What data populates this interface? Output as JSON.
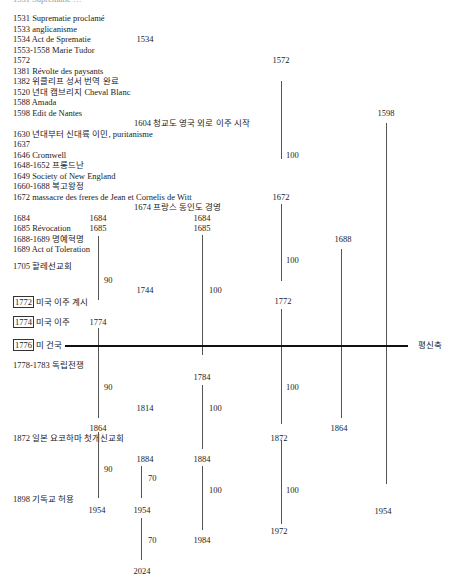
{
  "header_cut_text": "1531 Suprematie …",
  "events": [
    {
      "label": "1531 Suprematie proclamé",
      "x": 13,
      "y": 13
    },
    {
      "label": "1533 anglicanisme",
      "x": 13,
      "y": 24
    },
    {
      "label": "1534 Act de Sprematie",
      "x": 13,
      "y": 34
    },
    {
      "label": "1553-1558 Marie Tudor",
      "x": 13,
      "y": 45
    },
    {
      "label": "1572",
      "x": 13,
      "y": 55
    },
    {
      "label": "1381 Révolte des paysants",
      "x": 13,
      "y": 66
    },
    {
      "label": "1382 위클리프 성서 번역 완료",
      "x": 13,
      "y": 76
    },
    {
      "label": "1520 년대 캠브리지 Cheval Blanc",
      "x": 13,
      "y": 87
    },
    {
      "label": "1588 Amada",
      "x": 13,
      "y": 97
    },
    {
      "label": "1598 Edit de Nantes",
      "x": 13,
      "y": 108
    },
    {
      "label": "1604 청교도 영국 외로 이주 시작",
      "x": 134,
      "y": 118
    },
    {
      "label": "1630 년대부터 신대륙 이민, puritanisme",
      "x": 13,
      "y": 129
    },
    {
      "label": "1637",
      "x": 13,
      "y": 139
    },
    {
      "label": "1646 Cromwell",
      "x": 13,
      "y": 150
    },
    {
      "label": "1648-1652 프롱드난",
      "x": 13,
      "y": 160
    },
    {
      "label": "1649 Society of New England",
      "x": 13,
      "y": 171
    },
    {
      "label": "1660-1688 복고왕정",
      "x": 13,
      "y": 181
    },
    {
      "label": "1672 massacre des freres de Jean et Cornelis de Witt",
      "x": 13,
      "y": 192
    },
    {
      "label": "1674 프랑스 동인도 경영",
      "x": 134,
      "y": 202
    },
    {
      "label": "1684",
      "x": 13,
      "y": 213
    },
    {
      "label": "1685 Révocation",
      "x": 13,
      "y": 223
    },
    {
      "label": "1688-1689 명예혁명",
      "x": 13,
      "y": 234
    },
    {
      "label": "1689 Act of Toleration",
      "x": 13,
      "y": 244
    },
    {
      "label": "1705 할레선교회",
      "x": 13,
      "y": 261
    },
    {
      "label": "미국 이주 계시",
      "x": 13,
      "y": 297,
      "boxed_year": "1772"
    },
    {
      "label": "미국 이주",
      "x": 13,
      "y": 317,
      "boxed_year": "1774"
    },
    {
      "label": "미 건국",
      "x": 13,
      "y": 340,
      "boxed_year": "1776"
    },
    {
      "label": "1778-1783 독립전쟁",
      "x": 13,
      "y": 360
    },
    {
      "label": "1872 일본 요코하마 첫개신교회",
      "x": 13,
      "y": 433
    },
    {
      "label": "1898 기독교 허용",
      "x": 13,
      "y": 494
    }
  ],
  "axis": {
    "label": "평신축",
    "label_x": 418,
    "label_y": 340,
    "x1": 65,
    "x2": 408,
    "y": 345
  },
  "year_labels": [
    {
      "text": "1534",
      "x": 145,
      "y": 34
    },
    {
      "text": "1572",
      "x": 281,
      "y": 55
    },
    {
      "text": "1598",
      "x": 386,
      "y": 108
    },
    {
      "text": "1672",
      "x": 281,
      "y": 192
    },
    {
      "text": "1684",
      "x": 98,
      "y": 213
    },
    {
      "text": "1684",
      "x": 202,
      "y": 213
    },
    {
      "text": "1685",
      "x": 98,
      "y": 223
    },
    {
      "text": "1685",
      "x": 202,
      "y": 223
    },
    {
      "text": "1688",
      "x": 343,
      "y": 234
    },
    {
      "text": "1744",
      "x": 145,
      "y": 285
    },
    {
      "text": "1772",
      "x": 283,
      "y": 296
    },
    {
      "text": "1774",
      "x": 98,
      "y": 317
    },
    {
      "text": "1784",
      "x": 202,
      "y": 372
    },
    {
      "text": "1814",
      "x": 145,
      "y": 403
    },
    {
      "text": "1864",
      "x": 98,
      "y": 423
    },
    {
      "text": "1864",
      "x": 339,
      "y": 423
    },
    {
      "text": "1872",
      "x": 279,
      "y": 433
    },
    {
      "text": "1884",
      "x": 145,
      "y": 454
    },
    {
      "text": "1884",
      "x": 202,
      "y": 454
    },
    {
      "text": "1954",
      "x": 97,
      "y": 505
    },
    {
      "text": "1954",
      "x": 142,
      "y": 505
    },
    {
      "text": "1954",
      "x": 383,
      "y": 506
    },
    {
      "text": "1972",
      "x": 279,
      "y": 526
    },
    {
      "text": "1984",
      "x": 202,
      "y": 535
    },
    {
      "text": "2024",
      "x": 142,
      "y": 566
    }
  ],
  "durations": [
    {
      "text": "100",
      "x": 286,
      "y": 150
    },
    {
      "text": "100",
      "x": 286,
      "y": 255
    },
    {
      "text": "90",
      "x": 104,
      "y": 275
    },
    {
      "text": "100",
      "x": 209,
      "y": 285
    },
    {
      "text": "90",
      "x": 104,
      "y": 382
    },
    {
      "text": "100",
      "x": 286,
      "y": 382
    },
    {
      "text": "100",
      "x": 209,
      "y": 403
    },
    {
      "text": "90",
      "x": 104,
      "y": 464
    },
    {
      "text": "70",
      "x": 148,
      "y": 473
    },
    {
      "text": "100",
      "x": 209,
      "y": 485
    },
    {
      "text": "100",
      "x": 286,
      "y": 485
    },
    {
      "text": "70",
      "x": 148,
      "y": 535
    }
  ],
  "lines": [
    {
      "x": 281,
      "y1": 81,
      "y2": 159
    },
    {
      "x": 386,
      "y1": 123,
      "y2": 484
    },
    {
      "x": 281,
      "y1": 204,
      "y2": 281
    },
    {
      "x": 98,
      "y1": 236,
      "y2": 300
    },
    {
      "x": 202,
      "y1": 235,
      "y2": 355
    },
    {
      "x": 341,
      "y1": 249,
      "y2": 418
    },
    {
      "x": 281,
      "y1": 309,
      "y2": 424
    },
    {
      "x": 98,
      "y1": 328,
      "y2": 418
    },
    {
      "x": 202,
      "y1": 385,
      "y2": 449
    },
    {
      "x": 98,
      "y1": 432,
      "y2": 498
    },
    {
      "x": 141,
      "y1": 466,
      "y2": 498
    },
    {
      "x": 202,
      "y1": 466,
      "y2": 530
    },
    {
      "x": 281,
      "y1": 440,
      "y2": 524
    },
    {
      "x": 141,
      "y1": 518,
      "y2": 560
    }
  ]
}
